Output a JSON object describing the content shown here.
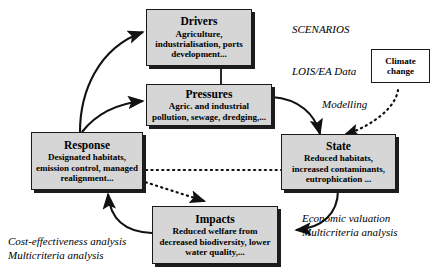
{
  "diagram": {
    "background_color": "#ffffff",
    "node_fill_color": "#d6d6d6",
    "node_border_color": "#1a1a1a",
    "external_node_fill_color": "#ffffff"
  },
  "nodes": {
    "drivers": {
      "title": "Drivers",
      "desc": "Agriculture,\nindustrialisation, ports\ndevelopment..."
    },
    "pressures": {
      "title": "Pressures",
      "desc": "Agric. and industrial\npollution, sewage, dredging,..."
    },
    "state": {
      "title": "State",
      "desc": "Reduced habitats,\nincreased contaminants,\neutrophication ..."
    },
    "impacts": {
      "title": "Impacts",
      "desc": "Reduced welfare from\ndecreased biodiversity,\nlower water quality,..."
    },
    "response": {
      "title": "Response",
      "desc": "Designated habitats,\nemission control,\nmanaged realignment..."
    },
    "climate_change": {
      "title": "Climate\nchange"
    }
  },
  "annotations": {
    "scenarios": "SCENARIOS",
    "lois_ea_data": "LOIS/EA Data",
    "modelling": "Modelling",
    "economic_valuation": "Economic valuation\nMulticriteria analysis",
    "cost_effectiveness": "Cost-effectiveness analysis\nMulticriteria analysis"
  }
}
